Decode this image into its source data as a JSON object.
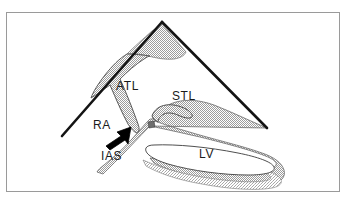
{
  "figure": {
    "kind": "anatomical-line-diagram",
    "frame": {
      "border_color": "#9a9a9a",
      "background_color": "#ffffff"
    },
    "style": {
      "outline_color": "#141414",
      "tissue_fill_color": "#d8d8d8",
      "tissue_stipple_color": "#a8a8a8",
      "lumen_fill_color": "#ffffff",
      "thin_outline_color": "#5a5a5a",
      "arrow_color": "#000000"
    },
    "labels": [
      {
        "id": "atl",
        "text": "ATL",
        "structure": "anterior tricuspid leaflet"
      },
      {
        "id": "stl",
        "text": "STL",
        "structure": "septal tricuspid leaflet"
      },
      {
        "id": "ra",
        "text": "RA",
        "structure": "right atrium"
      },
      {
        "id": "ias",
        "text": "IAS",
        "structure": "interatrial septum"
      },
      {
        "id": "lv",
        "text": "LV",
        "structure": "left ventricle"
      }
    ],
    "pointer": {
      "id": "septum-arrow",
      "shape": "solid-filled-arrow",
      "direction": "up-right",
      "from": [
        106,
        146
      ],
      "to": [
        131,
        127
      ]
    },
    "sector": {
      "apex": [
        162,
        22
      ],
      "left_end": [
        62,
        136
      ],
      "right_end": [
        267,
        128
      ]
    }
  }
}
